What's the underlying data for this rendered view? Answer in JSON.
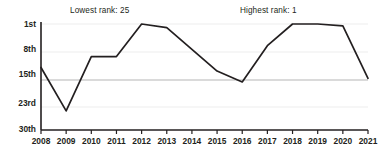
{
  "chart_data": {
    "type": "line",
    "title": "",
    "xlabel": "",
    "ylabel": "",
    "x": [
      2008,
      2009,
      2010,
      2011,
      2012,
      2013,
      2014,
      2015,
      2016,
      2017,
      2018,
      2019,
      2020,
      2021
    ],
    "values": [
      13,
      25,
      10,
      10,
      1,
      2,
      8,
      14,
      17,
      7,
      1,
      1,
      1.5,
      16
    ],
    "series": [
      {
        "name": "rank",
        "values": [
          13,
          25,
          10,
          10,
          1,
          2,
          8,
          14,
          17,
          7,
          1,
          1,
          1.5,
          16
        ]
      }
    ],
    "xtick_labels": [
      "2008",
      "2009",
      "2010",
      "2011",
      "2012",
      "2013",
      "2014",
      "2015",
      "2016",
      "2017",
      "2018",
      "2019",
      "2020",
      "2021"
    ],
    "ytick_values": [
      1,
      8,
      15,
      23,
      30
    ],
    "ytick_labels": [
      "1st",
      "8th",
      "15th",
      "23rd",
      "30th"
    ],
    "ylim": [
      1,
      30
    ],
    "y_inverted": true,
    "grid": true,
    "legend": "none",
    "line_color": "#231f20",
    "grid_color": "#e8e8e8",
    "emphasis_grid_color": "#b5b5b5",
    "axis_color": "#231f20",
    "annotations": [
      {
        "id": "lowest",
        "text": "Lowest rank: 25"
      },
      {
        "id": "highest",
        "text": "Highest rank: 1"
      }
    ]
  }
}
